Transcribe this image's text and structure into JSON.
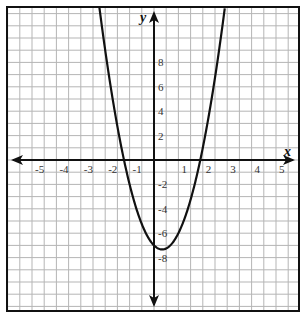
{
  "chart_data": {
    "type": "line",
    "title": "",
    "xlabel": "x",
    "ylabel": "y",
    "xlim": [
      -6.0,
      5.9
    ],
    "ylim": [
      -12.4,
      12.5
    ],
    "grid": true,
    "x_grid_step": 0.5,
    "y_grid_step": 1,
    "x_ticks": [
      -5,
      -4,
      -3,
      -2,
      -1,
      1,
      2,
      3,
      4,
      5
    ],
    "y_ticks": [
      8,
      6,
      4,
      2,
      -2,
      -4,
      -6,
      -8
    ],
    "series": [
      {
        "name": "parabola",
        "equation_estimate": "y = 3x^2 - 2x - 7",
        "coefficients": {
          "a": 3,
          "b": -2,
          "c": -7
        },
        "vertex": [
          0.33,
          -7.33
        ],
        "roots": [
          -1.23,
          1.9
        ],
        "x_range": [
          -2.24,
          2.9
        ]
      }
    ]
  },
  "axes": {
    "x_label": "x",
    "y_label": "y"
  }
}
